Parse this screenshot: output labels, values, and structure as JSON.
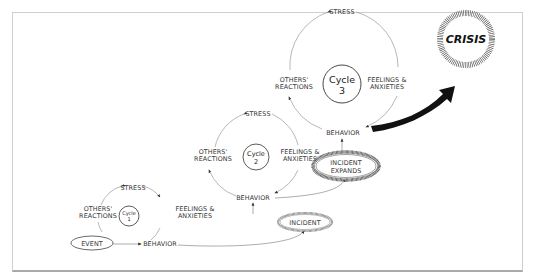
{
  "diagram": {
    "nodes": {
      "event": "EVENT",
      "incident": "INCIDENT",
      "incident_expands_1": "INCIDENT",
      "incident_expands_2": "EXPANDS",
      "crisis": "CRISIS"
    },
    "cycles": [
      {
        "name_line1": "Cycle",
        "name_line2": "1",
        "stress": "STRESS",
        "feelings_line1": "FEELINGS &",
        "feelings_line2": "ANXIETIES",
        "behavior": "BEHAVIOR",
        "reactions_line1": "OTHERS'",
        "reactions_line2": "REACTIONS"
      },
      {
        "name_line1": "Cycle",
        "name_line2": "2",
        "stress": "STRESS",
        "feelings_line1": "FEELINGS &",
        "feelings_line2": "ANXIETIES",
        "behavior": "BEHAVIOR",
        "reactions_line1": "OTHERS'",
        "reactions_line2": "REACTIONS"
      },
      {
        "name_line1": "Cycle",
        "name_line2": "3",
        "stress": "STRESS",
        "feelings_line1": "FEELINGS &",
        "feelings_line2": "ANXIETIES",
        "behavior": "BEHAVIOR",
        "reactions_line1": "OTHERS'",
        "reactions_line2": "REACTIONS"
      }
    ],
    "colors": {
      "line": "#8a8a8a",
      "text": "#333333",
      "arrow_dark": "#111111",
      "frame": "#cfcfcf"
    }
  }
}
